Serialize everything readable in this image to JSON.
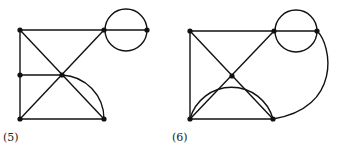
{
  "figures": [
    {
      "label": "(5)",
      "nodes": [
        {
          "id": "a",
          "x": 20,
          "y": 30
        },
        {
          "id": "b",
          "x": 104,
          "y": 30
        },
        {
          "id": "c",
          "x": 147,
          "y": 30
        },
        {
          "id": "d",
          "x": 20,
          "y": 75
        },
        {
          "id": "e",
          "x": 62,
          "y": 75
        },
        {
          "id": "f",
          "x": 20,
          "y": 119
        },
        {
          "id": "g",
          "x": 104,
          "y": 119
        }
      ],
      "edges": [
        [
          "a",
          "b"
        ],
        [
          "b",
          "c"
        ],
        [
          "a",
          "d"
        ],
        [
          "d",
          "f"
        ],
        [
          "f",
          "g"
        ],
        [
          "a",
          "e"
        ],
        [
          "e",
          "g"
        ],
        [
          "f",
          "e"
        ],
        [
          "e",
          "b"
        ],
        [
          "d",
          "e"
        ]
      ],
      "loop_circle": {
        "cx": 126,
        "cy": 30,
        "r": 21
      },
      "arcs": [
        "e-g quarter arc"
      ]
    },
    {
      "label": "(6)",
      "nodes": [
        {
          "id": "a",
          "x": 190,
          "y": 31
        },
        {
          "id": "b",
          "x": 274,
          "y": 31
        },
        {
          "id": "c",
          "x": 317,
          "y": 31
        },
        {
          "id": "e",
          "x": 232,
          "y": 76
        },
        {
          "id": "f",
          "x": 190,
          "y": 119
        },
        {
          "id": "g",
          "x": 273,
          "y": 119
        }
      ],
      "edges": [
        [
          "a",
          "b"
        ],
        [
          "b",
          "c"
        ],
        [
          "a",
          "f"
        ],
        [
          "f",
          "g"
        ],
        [
          "a",
          "e"
        ],
        [
          "e",
          "g"
        ],
        [
          "f",
          "e"
        ],
        [
          "e",
          "b"
        ]
      ],
      "loop_circle": {
        "cx": 296,
        "cy": 31,
        "r": 21
      },
      "arcs": [
        "f-g semicircle through e",
        "c-g outer arc"
      ]
    }
  ]
}
